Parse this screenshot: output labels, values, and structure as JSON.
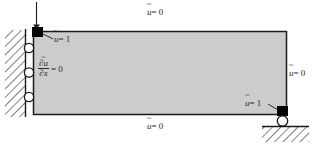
{
  "figure": {
    "domain_fill_color": "#cccccc",
    "domain_stroke_color": "#1a1a1a",
    "marker_color": "#000000",
    "hatch_color": "#1a1a1a",
    "background_color": "#ffffff",
    "domain": {
      "x": 33,
      "y": 31,
      "width": 254,
      "height": 84
    },
    "labels": {
      "top": {
        "var": "u",
        "accent": "tilde",
        "relation": "= 0",
        "text": "ũ = 0",
        "x": 155,
        "y": 14
      },
      "bottom": {
        "var": "u",
        "accent": "tilde",
        "relation": "= 0",
        "text": "ũ = 0",
        "x": 155,
        "y": 125
      },
      "right": {
        "var": "u",
        "accent": "tilde",
        "relation": "= 0",
        "text": "ũ = 0",
        "x": 295,
        "y": 73
      },
      "top_left_marker": {
        "var": "u",
        "accent": "tilde",
        "relation": "= 1",
        "text": "ũ = 1",
        "x": 54,
        "y": 40
      },
      "bottom_right_marker": {
        "var": "u",
        "accent": "tilde",
        "relation": "= 1",
        "text": "ũ = 1",
        "x": 249,
        "y": 105
      },
      "left_flux": {
        "numerator": "∂ũ",
        "denominator": "∂x",
        "relation": "= 0",
        "text": "∂ũ/∂x = 0",
        "x": 39,
        "y": 66
      }
    },
    "markers": {
      "top_left_square": {
        "x": 33,
        "y": 28,
        "size": 10
      },
      "bottom_right_square": {
        "x": 278,
        "y": 107,
        "size": 10
      }
    },
    "supports": {
      "left_wall_rollers": [
        {
          "cx": 29,
          "cy": 48,
          "r": 4.5
        },
        {
          "cx": 29,
          "cy": 73,
          "r": 4.5
        },
        {
          "cx": 29,
          "cy": 97,
          "r": 4.5
        }
      ],
      "bottom_right_roller": {
        "cx": 283,
        "cy": 121,
        "r": 5
      }
    },
    "arrow": {
      "label": "applied-load-arrow",
      "x": 36,
      "y_start": 2,
      "y_end": 28
    },
    "ground": {
      "left_wall": {
        "x": 25,
        "y_top": 30,
        "y_bottom": 116
      },
      "bottom_right_ground": {
        "x_left": 262,
        "x_right": 308,
        "y": 126
      }
    }
  }
}
